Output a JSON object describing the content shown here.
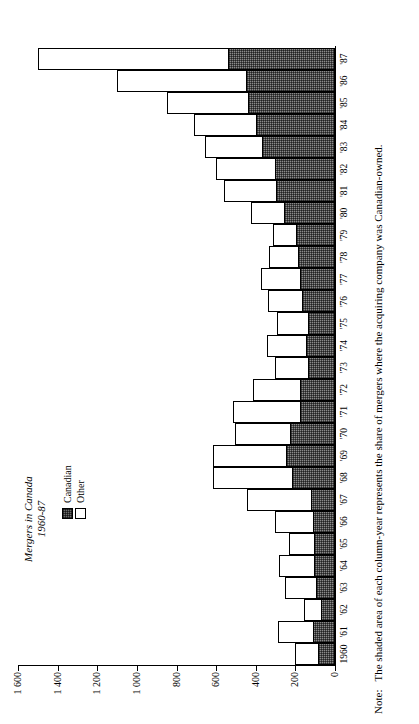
{
  "title": {
    "line1": "Mergers in Canada",
    "line2": "1960-87"
  },
  "legend": {
    "position": "inside-top-left",
    "items": [
      {
        "label": "Canadian",
        "swatch": "shaded-hatch",
        "color": "#6e6e6e"
      },
      {
        "label": "Other",
        "swatch": "white-outline",
        "color": "#ffffff"
      }
    ]
  },
  "note": {
    "prefix": "Note:",
    "text": "The shaded area of each column-year represents the share of mergers where the acquiring company was Canadian-owned."
  },
  "axes": {
    "y_ticklabels": [
      "1 600",
      "1 400",
      "1 200",
      "1 000",
      "800",
      "600",
      "400",
      "200",
      "0"
    ],
    "y_tickvalues": [
      1600,
      1400,
      1200,
      1000,
      800,
      600,
      400,
      200,
      0
    ],
    "orientation": "rotated-90-ccw"
  },
  "chart_data": {
    "type": "bar",
    "title": "Mergers in Canada 1960-87",
    "xlabel": "",
    "ylabel": "",
    "ylim": [
      0,
      1600
    ],
    "grid": false,
    "stacked": true,
    "legend_position": "upper left",
    "categories": [
      "1960",
      "'61",
      "'62",
      "'63",
      "'64",
      "'65",
      "'66",
      "'67",
      "'68",
      "'69",
      "'70",
      "'71",
      "'72",
      "'73",
      "'74",
      "'75",
      "'76",
      "'77",
      "'78",
      "'79",
      "'80",
      "'81",
      "'82",
      "'83",
      "'84",
      "'85",
      "'86",
      "'87"
    ],
    "series": [
      {
        "name": "Canadian",
        "values": [
          85,
          110,
          70,
          95,
          105,
          105,
          110,
          120,
          215,
          245,
          225,
          175,
          175,
          135,
          145,
          135,
          165,
          175,
          185,
          195,
          255,
          300,
          305,
          370,
          400,
          440,
          450,
          540
        ]
      },
      {
        "name": "Other",
        "values": [
          115,
          180,
          85,
          155,
          180,
          125,
          195,
          325,
          400,
          370,
          280,
          340,
          240,
          170,
          200,
          160,
          175,
          200,
          150,
          120,
          170,
          260,
          295,
          285,
          310,
          410,
          650,
          960
        ]
      }
    ],
    "totals": [
      200,
      290,
      155,
      250,
      285,
      230,
      305,
      445,
      615,
      615,
      505,
      515,
      415,
      305,
      345,
      295,
      340,
      375,
      335,
      315,
      425,
      560,
      600,
      655,
      710,
      850,
      1100,
      1500
    ]
  }
}
